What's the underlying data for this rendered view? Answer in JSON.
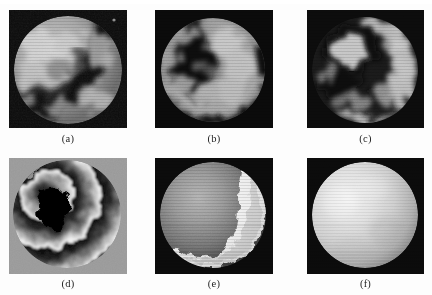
{
  "figure": {
    "kind": "image-panel-grid",
    "rows": 2,
    "columns": 3,
    "background_color": "#fdfdfd",
    "caption_color": "#232323",
    "panels": [
      {
        "id": "a",
        "caption": "(a)",
        "content": "speckle-interferogram-circular-aperture",
        "description": "Grayscale speckle interferogram: bright mottled disc on near-black square background with a dark curved fringe band running top-right to lower-left.",
        "background_color": "#0b0b0b",
        "disc_color": "#b9b9b9",
        "fringe_color": "#151515",
        "x": 9,
        "y": 10,
        "width": 118,
        "height": 118
      },
      {
        "id": "b",
        "caption": "(b)",
        "content": "speckle-interferogram-circular-aperture",
        "description": "Grayscale speckle interferogram: dark C-shaped core region surrounded by a bright mottled annulus inside a circular aperture.",
        "background_color": "#0a0a0a",
        "disc_color": "#b3b3b3",
        "fringe_color": "#121212",
        "x": 155,
        "y": 10,
        "width": 118,
        "height": 118
      },
      {
        "id": "c",
        "caption": "(c)",
        "content": "speckle-interferogram-circular-aperture",
        "description": "Grayscale speckle interferogram: bright blob at upper-left encircled by a dark ring, with a broad bright crescent arc on the right and bottom.",
        "background_color": "#0c0c0c",
        "disc_color": "#b0b0b0",
        "fringe_color": "#131313",
        "x": 307,
        "y": 10,
        "width": 117,
        "height": 118
      },
      {
        "id": "d",
        "caption": "(d)",
        "content": "wrapped-phase-map",
        "description": "Wrapped phase map on a mid-gray square: black-to-white sawtooth fringes forming concentric arcs around a solid black central blob, with sharp 2-pi discontinuity lines.",
        "background_color": "#9a9a9a",
        "disc_color": "#efefef",
        "fringe_color": "#050505",
        "x": 9,
        "y": 158,
        "width": 118,
        "height": 116
      },
      {
        "id": "e",
        "caption": "(e)",
        "content": "partially-unwrapped-phase-surface",
        "description": "Partially unwrapped phase: smooth gray sphere-like surface on black, with a bright white crescent band along the right and bottom edge and a jagged boundary between regions.",
        "background_color": "#0b0b0b",
        "disc_color": "#8e8e8e",
        "fringe_color": "#f2f2f2",
        "x": 155,
        "y": 158,
        "width": 118,
        "height": 116
      },
      {
        "id": "f",
        "caption": "(f)",
        "content": "fully-unwrapped-phase-surface",
        "description": "Fully unwrapped continuous phase surface rendered as a smooth bright sphere on a black square background.",
        "background_color": "#0b0b0b",
        "disc_color": "#e4e4e4",
        "fringe_color": "#c8c8c8",
        "x": 307,
        "y": 158,
        "width": 117,
        "height": 116
      }
    ],
    "captions_row_1_y": 134,
    "captions_row_2_y": 278
  }
}
